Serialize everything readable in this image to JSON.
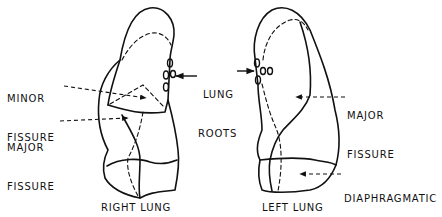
{
  "diagram": {
    "type": "anatomical-line-drawing",
    "colors": {
      "ink": "#111111",
      "background": "#ffffff"
    },
    "labels": {
      "minor_fissure_line1": "MINOR",
      "minor_fissure_line2": "FISSURE",
      "major_fissure_right_line1": "MAJOR",
      "major_fissure_right_line2": "FISSURE",
      "lung_roots_line1": "LUNG",
      "lung_roots_line2": "ROOTS",
      "major_fissure_left_line1": "MAJOR",
      "major_fissure_left_line2": "FISSURE",
      "diaphragmatic_line1": "DIAPHRAGMATIC",
      "diaphragmatic_line2": "SURFACE",
      "right_lung": "RIGHT LUNG",
      "left_lung": "LEFT LUNG"
    },
    "structures": [
      {
        "name": "right-lung",
        "annotations": [
          "minor fissure",
          "major fissure",
          "lung roots"
        ]
      },
      {
        "name": "left-lung",
        "annotations": [
          "major fissure",
          "lung roots",
          "diaphragmatic surface"
        ]
      }
    ]
  }
}
